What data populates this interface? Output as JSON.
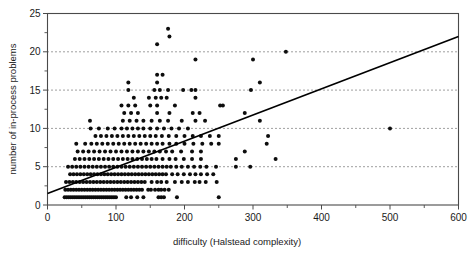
{
  "chart_data": {
    "type": "scatter",
    "title": "",
    "xlabel": "difficulty (Halstead complexity)",
    "ylabel": "number of in-process problems",
    "xlim": [
      0,
      600
    ],
    "ylim": [
      0,
      25
    ],
    "xticks": [
      0,
      100,
      200,
      300,
      400,
      500,
      600
    ],
    "yticks": [
      0,
      5,
      10,
      15,
      20,
      25
    ],
    "xtick_labels": [
      "0",
      "100",
      "200",
      "300",
      "400",
      "500",
      "600"
    ],
    "ytick_labels": [
      "0",
      "5",
      "10",
      "15",
      "20",
      "25"
    ],
    "y_minor_ticks": [
      2.5,
      7.5,
      12.5,
      17.5,
      22.5
    ],
    "x_minor_ticks": [
      50,
      150,
      250,
      350,
      450,
      550
    ],
    "grid": "horizontal-dotted at y = 5, 10, 15, 20",
    "gridlines_y": [
      5,
      10,
      15,
      20
    ],
    "legend": "none",
    "marker": "filled circle",
    "marker_color": "#0d0d0d",
    "fit_line": {
      "name": "linear regression",
      "x": [
        0,
        600
      ],
      "y": [
        1.5,
        22.0
      ],
      "slope": 0.0342,
      "intercept": 1.5,
      "color": "#000000"
    },
    "points": [
      [
        25,
        1
      ],
      [
        28,
        1
      ],
      [
        31,
        1
      ],
      [
        34,
        1
      ],
      [
        37,
        1
      ],
      [
        40,
        1
      ],
      [
        43,
        1
      ],
      [
        46,
        1
      ],
      [
        49,
        1
      ],
      [
        52,
        1
      ],
      [
        55,
        1
      ],
      [
        58,
        1
      ],
      [
        61,
        1
      ],
      [
        64,
        1
      ],
      [
        67,
        1
      ],
      [
        70,
        1
      ],
      [
        73,
        1
      ],
      [
        76,
        1
      ],
      [
        79,
        1
      ],
      [
        82,
        1
      ],
      [
        85,
        1
      ],
      [
        88,
        1
      ],
      [
        91,
        1
      ],
      [
        94,
        1
      ],
      [
        97,
        1
      ],
      [
        100,
        1
      ],
      [
        115,
        1
      ],
      [
        122,
        1
      ],
      [
        131,
        1
      ],
      [
        140,
        1
      ],
      [
        162,
        1
      ],
      [
        166,
        1
      ],
      [
        170,
        1
      ],
      [
        189,
        1
      ],
      [
        250,
        1
      ],
      [
        26,
        2
      ],
      [
        30,
        2
      ],
      [
        34,
        2
      ],
      [
        38,
        2
      ],
      [
        42,
        2
      ],
      [
        46,
        2
      ],
      [
        50,
        2
      ],
      [
        54,
        2
      ],
      [
        58,
        2
      ],
      [
        62,
        2
      ],
      [
        66,
        2
      ],
      [
        70,
        2
      ],
      [
        74,
        2
      ],
      [
        78,
        2
      ],
      [
        82,
        2
      ],
      [
        86,
        2
      ],
      [
        90,
        2
      ],
      [
        94,
        2
      ],
      [
        98,
        2
      ],
      [
        102,
        2
      ],
      [
        106,
        2
      ],
      [
        110,
        2
      ],
      [
        114,
        2
      ],
      [
        118,
        2
      ],
      [
        122,
        2
      ],
      [
        126,
        2
      ],
      [
        130,
        2
      ],
      [
        134,
        2
      ],
      [
        138,
        2
      ],
      [
        147,
        2
      ],
      [
        151,
        2
      ],
      [
        157,
        2
      ],
      [
        162,
        2
      ],
      [
        166,
        2
      ],
      [
        171,
        2
      ],
      [
        177,
        2
      ],
      [
        27,
        3
      ],
      [
        32,
        3
      ],
      [
        37,
        3
      ],
      [
        42,
        3
      ],
      [
        47,
        3
      ],
      [
        52,
        3
      ],
      [
        57,
        3
      ],
      [
        62,
        3
      ],
      [
        67,
        3
      ],
      [
        72,
        3
      ],
      [
        77,
        3
      ],
      [
        82,
        3
      ],
      [
        87,
        3
      ],
      [
        92,
        3
      ],
      [
        97,
        3
      ],
      [
        102,
        3
      ],
      [
        107,
        3
      ],
      [
        112,
        3
      ],
      [
        117,
        3
      ],
      [
        122,
        3
      ],
      [
        127,
        3
      ],
      [
        132,
        3
      ],
      [
        137,
        3
      ],
      [
        142,
        3
      ],
      [
        152,
        3
      ],
      [
        160,
        3
      ],
      [
        166,
        3
      ],
      [
        174,
        3
      ],
      [
        186,
        3
      ],
      [
        196,
        3
      ],
      [
        205,
        3
      ],
      [
        215,
        3
      ],
      [
        222,
        3
      ],
      [
        231,
        3
      ],
      [
        247,
        3
      ],
      [
        33,
        4
      ],
      [
        38,
        4
      ],
      [
        43,
        4
      ],
      [
        48,
        4
      ],
      [
        53,
        4
      ],
      [
        58,
        4
      ],
      [
        63,
        4
      ],
      [
        68,
        4
      ],
      [
        73,
        4
      ],
      [
        78,
        4
      ],
      [
        83,
        4
      ],
      [
        88,
        4
      ],
      [
        93,
        4
      ],
      [
        98,
        4
      ],
      [
        103,
        4
      ],
      [
        108,
        4
      ],
      [
        113,
        4
      ],
      [
        118,
        4
      ],
      [
        123,
        4
      ],
      [
        128,
        4
      ],
      [
        133,
        4
      ],
      [
        138,
        4
      ],
      [
        143,
        4
      ],
      [
        148,
        4
      ],
      [
        153,
        4
      ],
      [
        158,
        4
      ],
      [
        163,
        4
      ],
      [
        168,
        4
      ],
      [
        173,
        4
      ],
      [
        182,
        4
      ],
      [
        190,
        4
      ],
      [
        199,
        4
      ],
      [
        208,
        4
      ],
      [
        216,
        4
      ],
      [
        224,
        4
      ],
      [
        233,
        4
      ],
      [
        242,
        4
      ],
      [
        30,
        5
      ],
      [
        36,
        5
      ],
      [
        42,
        5
      ],
      [
        48,
        5
      ],
      [
        54,
        5
      ],
      [
        60,
        5
      ],
      [
        66,
        5
      ],
      [
        72,
        5
      ],
      [
        78,
        5
      ],
      [
        84,
        5
      ],
      [
        90,
        5
      ],
      [
        96,
        5
      ],
      [
        102,
        5
      ],
      [
        108,
        5
      ],
      [
        114,
        5
      ],
      [
        120,
        5
      ],
      [
        126,
        5
      ],
      [
        132,
        5
      ],
      [
        138,
        5
      ],
      [
        144,
        5
      ],
      [
        150,
        5
      ],
      [
        156,
        5
      ],
      [
        162,
        5
      ],
      [
        168,
        5
      ],
      [
        174,
        5
      ],
      [
        180,
        5
      ],
      [
        188,
        5
      ],
      [
        196,
        5
      ],
      [
        205,
        5
      ],
      [
        214,
        5
      ],
      [
        223,
        5
      ],
      [
        232,
        5
      ],
      [
        246,
        5
      ],
      [
        275,
        5
      ],
      [
        296,
        5
      ],
      [
        40,
        6
      ],
      [
        47,
        6
      ],
      [
        54,
        6
      ],
      [
        61,
        6
      ],
      [
        68,
        6
      ],
      [
        75,
        6
      ],
      [
        82,
        6
      ],
      [
        89,
        6
      ],
      [
        96,
        6
      ],
      [
        103,
        6
      ],
      [
        110,
        6
      ],
      [
        117,
        6
      ],
      [
        124,
        6
      ],
      [
        131,
        6
      ],
      [
        138,
        6
      ],
      [
        145,
        6
      ],
      [
        152,
        6
      ],
      [
        159,
        6
      ],
      [
        168,
        6
      ],
      [
        178,
        6
      ],
      [
        187,
        6
      ],
      [
        199,
        6
      ],
      [
        211,
        6
      ],
      [
        224,
        6
      ],
      [
        275,
        6
      ],
      [
        333,
        6
      ],
      [
        44,
        7
      ],
      [
        52,
        7
      ],
      [
        60,
        7
      ],
      [
        68,
        7
      ],
      [
        76,
        7
      ],
      [
        84,
        7
      ],
      [
        92,
        7
      ],
      [
        100,
        7
      ],
      [
        108,
        7
      ],
      [
        116,
        7
      ],
      [
        124,
        7
      ],
      [
        132,
        7
      ],
      [
        140,
        7
      ],
      [
        148,
        7
      ],
      [
        156,
        7
      ],
      [
        164,
        7
      ],
      [
        173,
        7
      ],
      [
        182,
        7
      ],
      [
        195,
        7
      ],
      [
        211,
        7
      ],
      [
        224,
        7
      ],
      [
        288,
        7
      ],
      [
        42,
        8
      ],
      [
        55,
        8
      ],
      [
        64,
        8
      ],
      [
        72,
        8
      ],
      [
        80,
        8
      ],
      [
        88,
        8
      ],
      [
        96,
        8
      ],
      [
        104,
        8
      ],
      [
        112,
        8
      ],
      [
        120,
        8
      ],
      [
        128,
        8
      ],
      [
        136,
        8
      ],
      [
        144,
        8
      ],
      [
        152,
        8
      ],
      [
        160,
        8
      ],
      [
        168,
        8
      ],
      [
        178,
        8
      ],
      [
        188,
        8
      ],
      [
        200,
        8
      ],
      [
        213,
        8
      ],
      [
        226,
        8
      ],
      [
        239,
        8
      ],
      [
        250,
        8
      ],
      [
        320,
        8
      ],
      [
        70,
        9
      ],
      [
        78,
        9
      ],
      [
        86,
        9
      ],
      [
        94,
        9
      ],
      [
        102,
        9
      ],
      [
        110,
        9
      ],
      [
        118,
        9
      ],
      [
        126,
        9
      ],
      [
        134,
        9
      ],
      [
        142,
        9
      ],
      [
        150,
        9
      ],
      [
        158,
        9
      ],
      [
        167,
        9
      ],
      [
        177,
        9
      ],
      [
        188,
        9
      ],
      [
        200,
        9
      ],
      [
        212,
        9
      ],
      [
        224,
        9
      ],
      [
        237,
        9
      ],
      [
        250,
        9
      ],
      [
        322,
        9
      ],
      [
        63,
        10
      ],
      [
        75,
        10
      ],
      [
        88,
        10
      ],
      [
        98,
        10
      ],
      [
        108,
        10
      ],
      [
        116,
        10
      ],
      [
        124,
        10
      ],
      [
        132,
        10
      ],
      [
        140,
        10
      ],
      [
        150,
        10
      ],
      [
        160,
        10
      ],
      [
        170,
        10
      ],
      [
        181,
        10
      ],
      [
        192,
        10
      ],
      [
        205,
        10
      ],
      [
        500,
        10
      ],
      [
        62,
        11
      ],
      [
        110,
        11
      ],
      [
        120,
        11
      ],
      [
        130,
        11
      ],
      [
        140,
        11
      ],
      [
        152,
        11
      ],
      [
        164,
        11
      ],
      [
        176,
        11
      ],
      [
        196,
        11
      ],
      [
        216,
        11
      ],
      [
        230,
        11
      ],
      [
        310,
        11
      ],
      [
        112,
        12
      ],
      [
        122,
        12
      ],
      [
        132,
        12
      ],
      [
        160,
        12
      ],
      [
        178,
        12
      ],
      [
        212,
        12
      ],
      [
        222,
        12
      ],
      [
        288,
        12
      ],
      [
        108,
        13
      ],
      [
        118,
        13
      ],
      [
        128,
        13
      ],
      [
        150,
        13
      ],
      [
        160,
        13
      ],
      [
        186,
        13
      ],
      [
        252,
        13
      ],
      [
        256,
        13
      ],
      [
        126,
        14
      ],
      [
        148,
        14
      ],
      [
        158,
        14
      ],
      [
        166,
        14
      ],
      [
        174,
        14
      ],
      [
        216,
        14
      ],
      [
        118,
        15
      ],
      [
        156,
        15
      ],
      [
        164,
        15
      ],
      [
        176,
        15
      ],
      [
        198,
        15
      ],
      [
        210,
        15
      ],
      [
        216,
        15
      ],
      [
        297,
        15
      ],
      [
        118,
        16
      ],
      [
        160,
        16
      ],
      [
        310,
        16
      ],
      [
        160,
        17
      ],
      [
        168,
        17
      ],
      [
        216,
        19
      ],
      [
        300,
        19
      ],
      [
        348,
        20
      ],
      [
        160,
        21
      ],
      [
        178,
        22
      ],
      [
        176,
        23
      ]
    ],
    "n_points": "approximately 330"
  }
}
